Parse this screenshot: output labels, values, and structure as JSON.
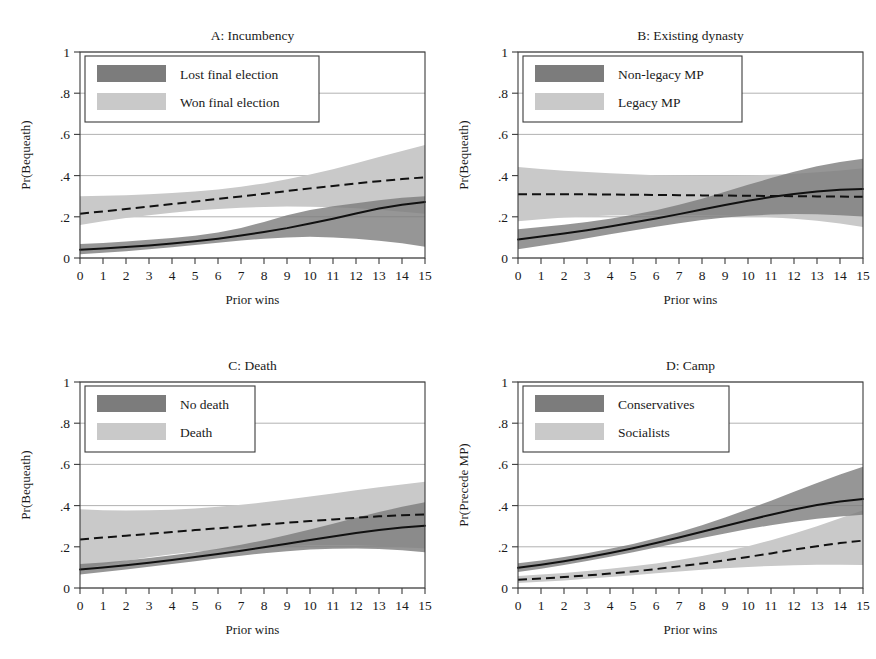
{
  "figure": {
    "background": "#ffffff",
    "dark_color": "#7c7c7c",
    "light_color": "#c9c9c9",
    "line_color": "#111111",
    "frame_color": "#3b3b3b",
    "grid_color": "#a9a9a9"
  },
  "axes": {
    "x_label": "Prior wins",
    "x_ticks": [
      "0",
      "1",
      "2",
      "3",
      "4",
      "5",
      "6",
      "7",
      "8",
      "9",
      "10",
      "11",
      "12",
      "13",
      "14",
      "15"
    ],
    "y_ticks": [
      "0",
      ".2",
      ".4",
      ".6",
      ".8",
      "1"
    ],
    "xlim": [
      0,
      15
    ],
    "ylim": [
      0,
      1
    ]
  },
  "chart_data": [
    {
      "id": "A",
      "type": "line",
      "title": "A: Incumbency",
      "xlabel": "Prior wins",
      "ylabel": "Pr(Bequeath)",
      "xlim": [
        0,
        15
      ],
      "ylim": [
        0,
        1
      ],
      "grid": true,
      "legend_position": "top-left",
      "x": [
        0,
        1,
        2,
        3,
        4,
        5,
        6,
        7,
        8,
        9,
        10,
        11,
        12,
        13,
        14,
        15
      ],
      "series": [
        {
          "name": "Lost final election",
          "color": "#7c7c7c",
          "linestyle": "solid",
          "values": [
            0.04,
            0.046,
            0.053,
            0.061,
            0.07,
            0.081,
            0.094,
            0.109,
            0.126,
            0.145,
            0.167,
            0.191,
            0.216,
            0.24,
            0.259,
            0.272
          ],
          "ci_low": [
            0.018,
            0.025,
            0.033,
            0.042,
            0.052,
            0.063,
            0.074,
            0.085,
            0.094,
            0.1,
            0.103,
            0.1,
            0.094,
            0.084,
            0.071,
            0.055
          ],
          "ci_high": [
            0.068,
            0.073,
            0.08,
            0.088,
            0.097,
            0.108,
            0.124,
            0.146,
            0.175,
            0.208,
            0.233,
            0.251,
            0.266,
            0.28,
            0.292,
            0.3
          ]
        },
        {
          "name": "Won final election",
          "color": "#c9c9c9",
          "linestyle": "dashed",
          "values": [
            0.215,
            0.226,
            0.238,
            0.25,
            0.262,
            0.274,
            0.287,
            0.299,
            0.312,
            0.325,
            0.338,
            0.35,
            0.362,
            0.373,
            0.383,
            0.392
          ],
          "ci_low": [
            0.16,
            0.178,
            0.194,
            0.208,
            0.22,
            0.23,
            0.238,
            0.244,
            0.248,
            0.25,
            0.249,
            0.246,
            0.241,
            0.234,
            0.225,
            0.215
          ],
          "ci_high": [
            0.3,
            0.302,
            0.305,
            0.309,
            0.315,
            0.323,
            0.333,
            0.346,
            0.362,
            0.382,
            0.405,
            0.431,
            0.46,
            0.49,
            0.52,
            0.548
          ]
        }
      ]
    },
    {
      "id": "B",
      "type": "line",
      "title": "B: Existing dynasty",
      "xlabel": "Prior wins",
      "ylabel": "Pr(Bequeath)",
      "xlim": [
        0,
        15
      ],
      "ylim": [
        0,
        1
      ],
      "grid": true,
      "legend_position": "top-left",
      "x": [
        0,
        1,
        2,
        3,
        4,
        5,
        6,
        7,
        8,
        9,
        10,
        11,
        12,
        13,
        14,
        15
      ],
      "series": [
        {
          "name": "Non-legacy MP",
          "color": "#7c7c7c",
          "linestyle": "solid",
          "values": [
            0.09,
            0.104,
            0.119,
            0.135,
            0.153,
            0.172,
            0.192,
            0.213,
            0.235,
            0.257,
            0.278,
            0.296,
            0.311,
            0.323,
            0.331,
            0.335
          ],
          "ci_low": [
            0.042,
            0.059,
            0.077,
            0.096,
            0.115,
            0.134,
            0.152,
            0.169,
            0.184,
            0.196,
            0.205,
            0.211,
            0.213,
            0.212,
            0.208,
            0.201
          ],
          "ci_high": [
            0.14,
            0.15,
            0.162,
            0.175,
            0.191,
            0.21,
            0.232,
            0.258,
            0.288,
            0.321,
            0.355,
            0.388,
            0.419,
            0.445,
            0.466,
            0.482
          ]
        },
        {
          "name": "Legacy MP",
          "color": "#c9c9c9",
          "linestyle": "dashed",
          "values": [
            0.31,
            0.31,
            0.31,
            0.309,
            0.308,
            0.307,
            0.306,
            0.305,
            0.304,
            0.303,
            0.302,
            0.301,
            0.3,
            0.299,
            0.298,
            0.297
          ],
          "ci_low": [
            0.178,
            0.188,
            0.196,
            0.202,
            0.206,
            0.208,
            0.209,
            0.209,
            0.208,
            0.206,
            0.203,
            0.198,
            0.191,
            0.181,
            0.168,
            0.15
          ],
          "ci_high": [
            0.442,
            0.432,
            0.424,
            0.417,
            0.411,
            0.406,
            0.402,
            0.4,
            0.399,
            0.399,
            0.401,
            0.404,
            0.409,
            0.416,
            0.425,
            0.436
          ]
        }
      ]
    },
    {
      "id": "C",
      "type": "line",
      "title": "C: Death",
      "xlabel": "Prior wins",
      "ylabel": "Pr(Bequeath)",
      "xlim": [
        0,
        15
      ],
      "ylim": [
        0,
        1
      ],
      "grid": true,
      "legend_position": "top-left",
      "x": [
        0,
        1,
        2,
        3,
        4,
        5,
        6,
        7,
        8,
        9,
        10,
        11,
        12,
        13,
        14,
        15
      ],
      "series": [
        {
          "name": "No death",
          "color": "#7c7c7c",
          "linestyle": "solid",
          "values": [
            0.09,
            0.1,
            0.111,
            0.123,
            0.136,
            0.15,
            0.165,
            0.181,
            0.198,
            0.215,
            0.233,
            0.25,
            0.267,
            0.282,
            0.294,
            0.302
          ],
          "ci_low": [
            0.066,
            0.078,
            0.09,
            0.103,
            0.116,
            0.13,
            0.144,
            0.157,
            0.169,
            0.179,
            0.187,
            0.191,
            0.192,
            0.189,
            0.183,
            0.174
          ],
          "ci_high": [
            0.116,
            0.124,
            0.134,
            0.146,
            0.159,
            0.174,
            0.191,
            0.21,
            0.232,
            0.257,
            0.284,
            0.312,
            0.341,
            0.369,
            0.394,
            0.416
          ]
        },
        {
          "name": "Death",
          "color": "#c9c9c9",
          "linestyle": "dashed",
          "values": [
            0.236,
            0.245,
            0.254,
            0.263,
            0.272,
            0.281,
            0.29,
            0.299,
            0.308,
            0.317,
            0.325,
            0.333,
            0.341,
            0.348,
            0.353,
            0.357
          ],
          "ci_low": [
            0.09,
            0.112,
            0.132,
            0.149,
            0.164,
            0.176,
            0.186,
            0.194,
            0.2,
            0.204,
            0.207,
            0.208,
            0.207,
            0.204,
            0.199,
            0.192
          ],
          "ci_high": [
            0.382,
            0.378,
            0.376,
            0.377,
            0.38,
            0.386,
            0.394,
            0.404,
            0.416,
            0.43,
            0.444,
            0.459,
            0.474,
            0.489,
            0.503,
            0.516
          ]
        }
      ]
    },
    {
      "id": "D",
      "type": "line",
      "title": "D: Camp",
      "xlabel": "Prior wins",
      "ylabel": "Pr(Precede MP)",
      "xlim": [
        0,
        15
      ],
      "ylim": [
        0,
        1
      ],
      "grid": true,
      "legend_position": "top-left",
      "x": [
        0,
        1,
        2,
        3,
        4,
        5,
        6,
        7,
        8,
        9,
        10,
        11,
        12,
        13,
        14,
        15
      ],
      "series": [
        {
          "name": "Conservatives",
          "color": "#7c7c7c",
          "linestyle": "solid",
          "values": [
            0.098,
            0.113,
            0.13,
            0.149,
            0.17,
            0.193,
            0.218,
            0.245,
            0.273,
            0.301,
            0.329,
            0.356,
            0.381,
            0.403,
            0.42,
            0.432
          ],
          "ci_low": [
            0.078,
            0.094,
            0.112,
            0.131,
            0.152,
            0.174,
            0.197,
            0.22,
            0.243,
            0.265,
            0.286,
            0.305,
            0.322,
            0.336,
            0.347,
            0.355
          ],
          "ci_high": [
            0.12,
            0.134,
            0.15,
            0.169,
            0.19,
            0.214,
            0.241,
            0.271,
            0.305,
            0.342,
            0.382,
            0.424,
            0.467,
            0.51,
            0.551,
            0.588
          ]
        },
        {
          "name": "Socialists",
          "color": "#c9c9c9",
          "linestyle": "dashed",
          "values": [
            0.04,
            0.046,
            0.053,
            0.061,
            0.07,
            0.08,
            0.092,
            0.105,
            0.119,
            0.134,
            0.151,
            0.168,
            0.186,
            0.203,
            0.218,
            0.23
          ],
          "ci_low": [
            0.024,
            0.03,
            0.037,
            0.045,
            0.053,
            0.062,
            0.071,
            0.08,
            0.088,
            0.096,
            0.102,
            0.107,
            0.111,
            0.113,
            0.113,
            0.112
          ],
          "ci_high": [
            0.058,
            0.065,
            0.073,
            0.082,
            0.093,
            0.105,
            0.119,
            0.136,
            0.155,
            0.177,
            0.203,
            0.232,
            0.264,
            0.3,
            0.338,
            0.378
          ]
        }
      ]
    }
  ]
}
